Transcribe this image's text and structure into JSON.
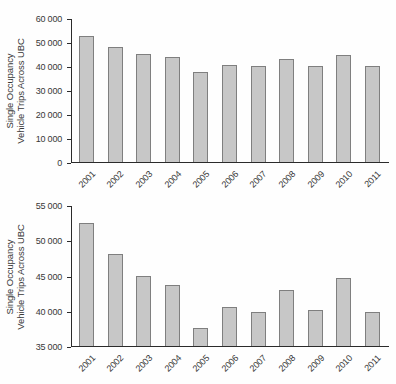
{
  "colors": {
    "bar_fill": "#c7c7c7",
    "bar_border": "#7f7f7f",
    "axis": "#2b2b2b",
    "text": "#383838",
    "background": "#fefefe"
  },
  "chart_data": [
    {
      "type": "bar",
      "title": "",
      "xlabel": "",
      "ylabel": "Single Occupancy Vehicle Trips Across UBC",
      "ylabel_lines": [
        "Single Occupancy",
        "Vehicle Trips Across UBC"
      ],
      "categories": [
        "2001",
        "2002",
        "2003",
        "2004",
        "2005",
        "2006",
        "2007",
        "2008",
        "2009",
        "2010",
        "2011"
      ],
      "values": [
        52500,
        48000,
        45000,
        43700,
        37600,
        40500,
        39800,
        43000,
        40100,
        44700,
        39800
      ],
      "ylim": [
        0,
        60000
      ],
      "yticks": [
        {
          "value": 0,
          "label": "0"
        },
        {
          "value": 10000,
          "label": "10 000"
        },
        {
          "value": 20000,
          "label": "20 000"
        },
        {
          "value": 30000,
          "label": "30 000"
        },
        {
          "value": 40000,
          "label": "40 000"
        },
        {
          "value": 50000,
          "label": "50 000"
        },
        {
          "value": 60000,
          "label": "60 000"
        }
      ],
      "grid": false,
      "legend": false
    },
    {
      "type": "bar",
      "title": "",
      "xlabel": "",
      "ylabel": "Single Occupancy Vehicle Trips Across UBC",
      "ylabel_lines": [
        "Single Occupancy",
        "Vehicle Trips Across UBC"
      ],
      "categories": [
        "2001",
        "2002",
        "2003",
        "2004",
        "2005",
        "2006",
        "2007",
        "2008",
        "2009",
        "2010",
        "2011"
      ],
      "values": [
        52500,
        48000,
        45000,
        43700,
        37600,
        40500,
        39800,
        43000,
        40100,
        44700,
        39800
      ],
      "ylim": [
        35000,
        55000
      ],
      "yticks": [
        {
          "value": 35000,
          "label": "35 000"
        },
        {
          "value": 40000,
          "label": "40 000"
        },
        {
          "value": 45000,
          "label": "45 000"
        },
        {
          "value": 50000,
          "label": "50 000"
        },
        {
          "value": 55000,
          "label": "55 000"
        }
      ],
      "grid": false,
      "legend": false
    }
  ]
}
